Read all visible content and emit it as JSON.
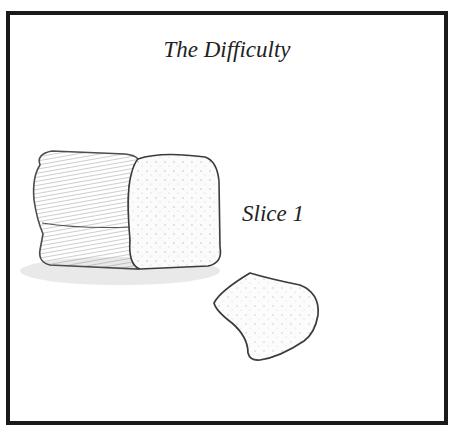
{
  "illustration": {
    "title": "The Difficulty",
    "label": "Slice 1",
    "style": "pencil sketch",
    "objects": [
      "bread-loaf",
      "bread-slice"
    ],
    "colors": {
      "frame": "#1a1a1a",
      "ink": "#333333",
      "background": "#ffffff"
    }
  }
}
